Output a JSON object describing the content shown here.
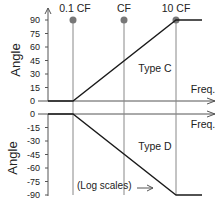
{
  "markers": [
    {
      "label": "0.1 CF",
      "x": 73
    },
    {
      "label": "CF",
      "x": 124
    },
    {
      "label": "10 CF",
      "x": 176
    }
  ],
  "top_panel": {
    "ylabel": "Angle",
    "ticks": [
      "90",
      "75",
      "60",
      "45",
      "30",
      "15",
      "0"
    ],
    "curve_label": "Type C",
    "xlabel": "Freq."
  },
  "bottom_panel": {
    "ylabel": "Angle",
    "ticks": [
      "0",
      "-15",
      "-30",
      "-45",
      "-60",
      "-75",
      "-90"
    ],
    "curve_label": "Type D",
    "xlabel": "Freq."
  },
  "note": "(Log scales)",
  "colors": {
    "curve": "#1a1a1a",
    "gridline": "#888888",
    "marker": "#777777"
  }
}
